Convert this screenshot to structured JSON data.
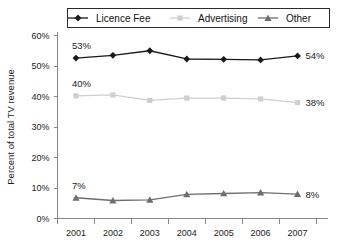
{
  "chart_data": {
    "type": "line",
    "title": "",
    "xlabel": "",
    "ylabel": "Percent of total TV revenue",
    "categories": [
      "2001",
      "2002",
      "2003",
      "2004",
      "2005",
      "2006",
      "2007"
    ],
    "ylim": [
      0,
      60
    ],
    "ytick_labels": [
      "0%",
      "10%",
      "20%",
      "30%",
      "40%",
      "50%",
      "60%"
    ],
    "ytick_values": [
      0,
      10,
      20,
      30,
      40,
      50,
      60
    ],
    "grid": false,
    "legend_position": "top",
    "series": [
      {
        "name": "Licence Fee",
        "values": [
          52.6,
          53.5,
          55.0,
          52.3,
          52.2,
          52.0,
          53.3
        ],
        "color": "#1a1a1a",
        "marker": "diamond"
      },
      {
        "name": "Advertising",
        "values": [
          40.2,
          40.5,
          38.7,
          39.5,
          39.5,
          39.2,
          38.0
        ],
        "color": "#cfcfcf",
        "marker": "square"
      },
      {
        "name": "Other",
        "values": [
          6.8,
          5.9,
          6.1,
          7.9,
          8.2,
          8.5,
          8.0
        ],
        "color": "#6e6e6e",
        "marker": "triangle"
      }
    ],
    "annotations": [
      {
        "text": "53%",
        "series": "Licence Fee",
        "side": "left",
        "x": 2001,
        "y": 52.6
      },
      {
        "text": "54%",
        "series": "Licence Fee",
        "side": "right",
        "x": 2007,
        "y": 53.3
      },
      {
        "text": "40%",
        "series": "Advertising",
        "side": "left",
        "x": 2001,
        "y": 40.2
      },
      {
        "text": "38%",
        "series": "Advertising",
        "side": "right",
        "x": 2007,
        "y": 38.0
      },
      {
        "text": "7%",
        "series": "Other",
        "side": "left",
        "x": 2001,
        "y": 6.8
      },
      {
        "text": "8%",
        "series": "Other",
        "side": "right",
        "x": 2007,
        "y": 8.0
      }
    ]
  },
  "legend": {
    "items": [
      {
        "label": "Licence Fee"
      },
      {
        "label": "Advertising"
      },
      {
        "label": "Other"
      }
    ]
  }
}
